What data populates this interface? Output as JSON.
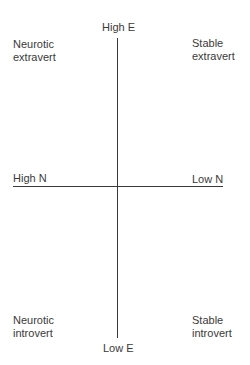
{
  "diagram": {
    "axes": {
      "vertical": {
        "top_label": "High E",
        "bottom_label": "Low E"
      },
      "horizontal": {
        "left_label": "High N",
        "right_label": "Low N"
      }
    },
    "quadrants": {
      "top_left": "Neurotic\nextravert",
      "top_right": "Stable\nextravert",
      "bottom_left": "Neurotic\nintrovert",
      "bottom_right": "Stable\nintrovert"
    }
  }
}
